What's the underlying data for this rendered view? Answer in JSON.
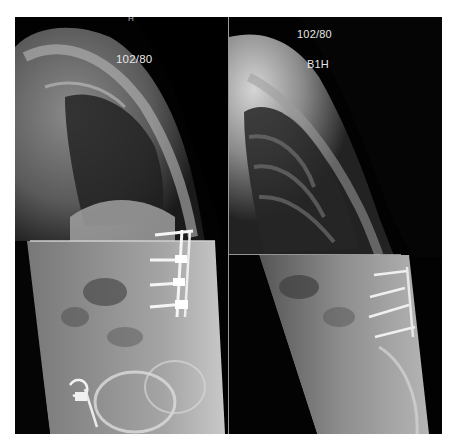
{
  "figure": {
    "panels": [
      {
        "position": "left",
        "view": "lateral standing radiograph (stitched)",
        "labels": {
          "blood_pressure": "102/80",
          "marker": "H"
        },
        "features": [
          "thoracic kyphosis",
          "lumbar pedicle screws and rods (4 levels)",
          "horizontal stitch line",
          "pelvic surgical clips"
        ]
      },
      {
        "position": "right",
        "view": "lateral standing radiograph (stitched)",
        "labels": {
          "blood_pressure": "102/80",
          "identifier": "B1H"
        },
        "features": [
          "thoracic kyphosis",
          "lumbar pedicle screws (4 levels)",
          "horizontal stitch line"
        ]
      }
    ],
    "colors": {
      "background": "#ffffff",
      "film": "#000000",
      "divider": "#9a9a9a",
      "label_text": "#e6e6e6"
    }
  }
}
